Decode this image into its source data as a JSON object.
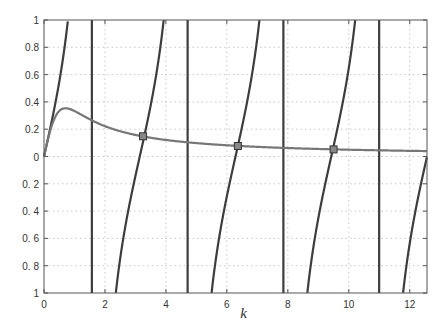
{
  "chart_data": {
    "type": "line",
    "title": "",
    "xlabel": "k",
    "ylabel": "",
    "xlim": [
      0,
      12.566
    ],
    "ylim": [
      -1,
      1
    ],
    "grid": true,
    "legend": null,
    "x_ticks": [
      0,
      2,
      4,
      6,
      8,
      10,
      12
    ],
    "x_tick_labels": [
      "0",
      "2",
      "4",
      "6",
      "8",
      "10",
      "12"
    ],
    "y_ticks": [
      1,
      0.8,
      0.6,
      0.4,
      0.2,
      0,
      -0.2,
      -0.4,
      -0.6,
      -0.8,
      -1
    ],
    "y_tick_labels": [
      "1",
      "0.8",
      "0.6",
      "0.4",
      "0.2",
      "0",
      "0. 2",
      "0. 4",
      "0. 6",
      "0. 8",
      "1"
    ],
    "series": [
      {
        "name": "tan(k)",
        "role": "periodic branches with vertical asymptote lines",
        "color": "#3d3d3d",
        "asymptotes": [
          1.571,
          4.712,
          7.854,
          10.996
        ]
      },
      {
        "name": "k/(1+2k^2)",
        "role": "decaying curve",
        "color": "#777777",
        "x": [
          0,
          0.3,
          0.707,
          1,
          1.571,
          2,
          3,
          3.25,
          4,
          5,
          6,
          6.36,
          7,
          8,
          9,
          9.5,
          10,
          11,
          12,
          12.566
        ],
        "y": [
          0,
          0.254,
          0.354,
          0.333,
          0.283,
          0.222,
          0.158,
          0.148,
          0.121,
          0.098,
          0.082,
          0.077,
          0.07,
          0.062,
          0.055,
          0.052,
          0.05,
          0.045,
          0.041,
          0.04
        ]
      }
    ],
    "annotations": [
      {
        "type": "intersection-marker",
        "shape": "square",
        "x": 3.25,
        "y": 0.148
      },
      {
        "type": "intersection-marker",
        "shape": "square",
        "x": 6.36,
        "y": 0.077
      },
      {
        "type": "intersection-marker",
        "shape": "square",
        "x": 9.5,
        "y": 0.052
      }
    ]
  }
}
